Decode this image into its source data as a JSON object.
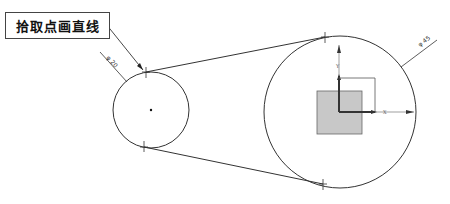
{
  "callout": {
    "label": "拾取点画直线"
  },
  "dimensions": {
    "small_circle_label": "φ 20",
    "large_circle_label": "φ 45"
  },
  "axes": {
    "x_label": "X",
    "y_label": "Y"
  },
  "colors": {
    "stroke": "#333333",
    "origin_fill": "#c8c8c8",
    "axis": "#444444"
  }
}
